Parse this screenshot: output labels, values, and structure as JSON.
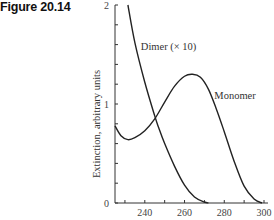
{
  "figure": {
    "label": "Figure 20.14"
  },
  "chart_data": {
    "type": "line",
    "title": "",
    "xlabel": "",
    "ylabel": "Extinction, arbitrary units",
    "xlim": [
      225,
      300
    ],
    "ylim": [
      0,
      2
    ],
    "x_ticks": [
      240,
      260,
      280,
      300
    ],
    "x_minor_ticks": [
      230,
      250,
      270,
      290
    ],
    "y_ticks": [
      0,
      1,
      2
    ],
    "y_minor_step": 0.2,
    "grid": false,
    "series": [
      {
        "name": "Dimer (× 10)",
        "label_position": [
          238,
          1.55
        ],
        "x": [
          231.5,
          235,
          240,
          245,
          247,
          250,
          255,
          260,
          265,
          270,
          272
        ],
        "y": [
          2.0,
          1.62,
          1.22,
          0.88,
          0.76,
          0.6,
          0.37,
          0.18,
          0.06,
          0.01,
          0.0
        ]
      },
      {
        "name": "Monomer",
        "label_position": [
          275,
          1.05
        ],
        "x": [
          225,
          228,
          231.5,
          235,
          240,
          245,
          247,
          250,
          255,
          260,
          264,
          268,
          272,
          276,
          280,
          285,
          290,
          295,
          299
        ],
        "y": [
          0.78,
          0.68,
          0.64,
          0.66,
          0.73,
          0.85,
          0.76,
          1.02,
          1.18,
          1.28,
          1.3,
          1.27,
          1.15,
          0.95,
          0.72,
          0.42,
          0.17,
          0.04,
          0.0
        ]
      }
    ]
  }
}
